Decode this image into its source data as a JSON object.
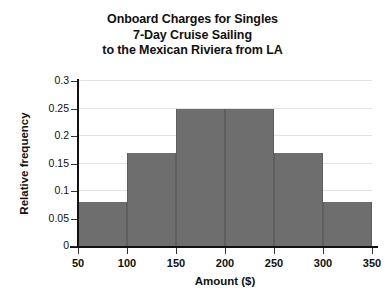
{
  "chart_data": {
    "type": "bar",
    "title": "Onboard Charges for Singles 7-Day Cruise Sailing to the Mexican Riviera from LA",
    "title_lines": [
      "Onboard Charges for Singles",
      "7-Day Cruise Sailing",
      "to the Mexican Riviera from LA"
    ],
    "xlabel": "Amount ($)",
    "ylabel": "Relative frequency",
    "xlim": [
      50,
      350
    ],
    "ylim": [
      0,
      0.3
    ],
    "bin_width": 50,
    "grid": true,
    "legend": false,
    "bar_color": "#6e6e6e",
    "bin_edges": [
      50,
      100,
      150,
      200,
      250,
      300,
      350
    ],
    "categories": [
      "50-100",
      "100-150",
      "150-200",
      "200-250",
      "250-300",
      "300-350"
    ],
    "values": [
      0.08,
      0.17,
      0.25,
      0.25,
      0.17,
      0.08
    ],
    "x_ticks": [
      {
        "value": 50,
        "label": "50"
      },
      {
        "value": 100,
        "label": "100"
      },
      {
        "value": 150,
        "label": "150"
      },
      {
        "value": 200,
        "label": "200"
      },
      {
        "value": 250,
        "label": "250"
      },
      {
        "value": 300,
        "label": "300"
      },
      {
        "value": 350,
        "label": "350"
      }
    ],
    "y_ticks": [
      {
        "value": 0,
        "label": "0"
      },
      {
        "value": 0.05,
        "label": "0.05"
      },
      {
        "value": 0.1,
        "label": "0.1"
      },
      {
        "value": 0.15,
        "label": "0.15"
      },
      {
        "value": 0.2,
        "label": "0.2"
      },
      {
        "value": 0.25,
        "label": "0.25"
      },
      {
        "value": 0.3,
        "label": "0.3"
      }
    ]
  }
}
